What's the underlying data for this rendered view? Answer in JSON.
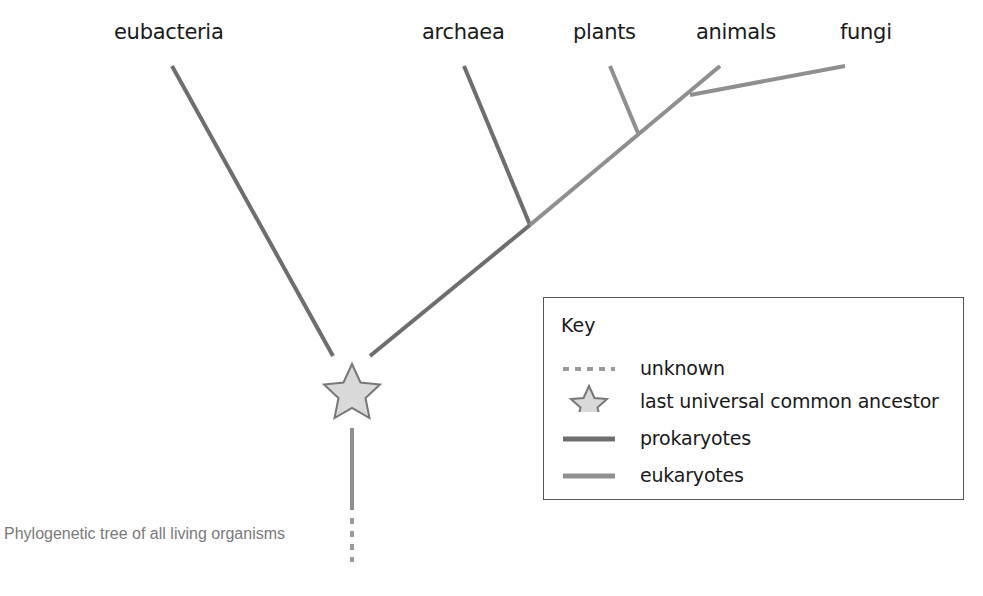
{
  "diagram": {
    "type": "phylogenetic-tree",
    "taxa": [
      {
        "label": "eubacteria",
        "group": "prokaryotes"
      },
      {
        "label": "archaea",
        "group": "prokaryotes"
      },
      {
        "label": "plants",
        "group": "eukaryotes"
      },
      {
        "label": "animals",
        "group": "eukaryotes"
      },
      {
        "label": "fungi",
        "group": "eukaryotes"
      }
    ],
    "root": "last universal common ancestor"
  },
  "key": {
    "title": "Key",
    "items": [
      {
        "symbol": "dashed-line",
        "label": "unknown"
      },
      {
        "symbol": "star-icon",
        "label": "last universal common ancestor"
      },
      {
        "symbol": "solid-line-dark",
        "label": "prokaryotes"
      },
      {
        "symbol": "solid-line-light",
        "label": "eukaryotes"
      }
    ]
  },
  "caption": "Phylogenetic tree of all living organisms",
  "colors": {
    "prokaryotes": "#6e6e6e",
    "eukaryotes": "#8f8f8f",
    "unknown": "#9a9a9a",
    "star_fill": "#d9d9d9",
    "star_stroke": "#777777",
    "text": "#1a1a1a",
    "caption": "#7a7a7a"
  }
}
